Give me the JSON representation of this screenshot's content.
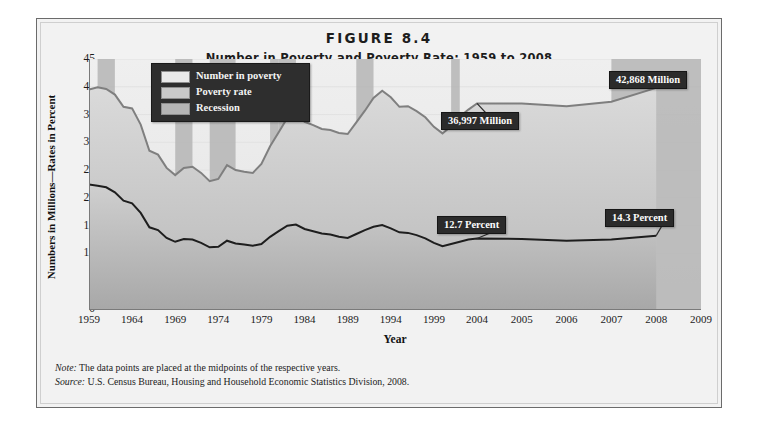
{
  "figure": {
    "number": "FIGURE 8.4",
    "title": "Number in Poverty and Poverty Rate: 1959 to 2008"
  },
  "axes": {
    "ylabel": "Numbers in Millions—Rates in Percent",
    "xlabel": "Year",
    "yticks": [
      "0",
      "5",
      "10",
      "15",
      "20",
      "25",
      "30",
      "35",
      "40",
      "45"
    ],
    "xticks": [
      "1959",
      "1964",
      "1969",
      "1974",
      "1979",
      "1984",
      "1989",
      "1994",
      "1999",
      "2004",
      "2005",
      "2006",
      "2007",
      "2008",
      "2009"
    ]
  },
  "legend": {
    "items": [
      {
        "label": "Number in poverty",
        "color": "#e9e9e9"
      },
      {
        "label": "Poverty rate",
        "color": "#c9c9c9"
      },
      {
        "label": "Recession",
        "color": "#b5b5b5"
      }
    ]
  },
  "callouts": [
    {
      "name": "number-in-poverty-2004",
      "text": "36,997 Million"
    },
    {
      "name": "number-in-poverty-2008",
      "text": "42,868 Million"
    },
    {
      "name": "poverty-rate-2004",
      "text": "12.7 Percent"
    },
    {
      "name": "poverty-rate-2008",
      "text": "14.3 Percent"
    }
  ],
  "notes": {
    "note_key": "Note:",
    "note_text": " The data points are placed at the midpoints of the respective years.",
    "source_key": "Source:",
    "source_text": " U.S. Census Bureau, Housing and Household Economic Statistics Division, 2008."
  },
  "colors": {
    "panel": "#f2f2f2",
    "plot": "#eeeeee",
    "number_line": "#7f7f7f",
    "rate_line": "#1e1e1e",
    "recession_bar": "#b5b5b5",
    "callout_bg": "#2b2b2b",
    "legend_bg": "#2e2e2e"
  },
  "chart_data": {
    "type": "area",
    "title": "Number in Poverty and Poverty Rate: 1959 to 2008",
    "xlabel": "Year",
    "ylabel": "Numbers in Millions—Rates in Percent",
    "ylim": [
      0,
      45
    ],
    "grid": true,
    "legend_position": "top-left",
    "x": [
      1959,
      1960,
      1961,
      1962,
      1963,
      1964,
      1965,
      1966,
      1967,
      1968,
      1969,
      1970,
      1971,
      1972,
      1973,
      1974,
      1975,
      1976,
      1977,
      1978,
      1979,
      1980,
      1981,
      1982,
      1983,
      1984,
      1985,
      1986,
      1987,
      1988,
      1989,
      1990,
      1991,
      1992,
      1993,
      1994,
      1995,
      1996,
      1997,
      1998,
      1999,
      2000,
      2001,
      2002,
      2003,
      2004,
      2005,
      2006,
      2007,
      2008
    ],
    "series": [
      {
        "name": "Number in poverty",
        "unit": "millions",
        "values": [
          39.5,
          39.9,
          39.6,
          38.6,
          36.4,
          36.1,
          33.2,
          28.5,
          27.8,
          25.4,
          24.1,
          25.4,
          25.6,
          24.5,
          23.0,
          23.4,
          25.9,
          25.0,
          24.7,
          24.5,
          26.1,
          29.3,
          31.8,
          34.4,
          35.3,
          33.7,
          33.1,
          32.4,
          32.2,
          31.7,
          31.5,
          33.6,
          35.7,
          38.0,
          39.3,
          38.1,
          36.4,
          36.5,
          35.6,
          34.5,
          32.8,
          31.6,
          32.9,
          34.6,
          35.9,
          37.0,
          37.0,
          36.5,
          37.3,
          39.8
        ]
      },
      {
        "name": "Poverty rate",
        "unit": "percent",
        "values": [
          22.4,
          22.2,
          21.9,
          21.0,
          19.5,
          19.0,
          17.3,
          14.7,
          14.2,
          12.8,
          12.1,
          12.6,
          12.5,
          11.9,
          11.1,
          11.2,
          12.3,
          11.8,
          11.6,
          11.4,
          11.7,
          13.0,
          14.0,
          15.0,
          15.2,
          14.4,
          14.0,
          13.6,
          13.4,
          13.0,
          12.8,
          13.5,
          14.2,
          14.8,
          15.1,
          14.5,
          13.8,
          13.7,
          13.3,
          12.7,
          11.9,
          11.3,
          11.7,
          12.1,
          12.5,
          12.7,
          12.6,
          12.3,
          12.5,
          13.2
        ]
      }
    ],
    "recessions": [
      {
        "start": 1960,
        "end": 1961
      },
      {
        "start": 1969,
        "end": 1970
      },
      {
        "start": 1973,
        "end": 1975
      },
      {
        "start": 1980,
        "end": 1980
      },
      {
        "start": 1981,
        "end": 1982
      },
      {
        "start": 1990,
        "end": 1991
      },
      {
        "start": 2001,
        "end": 2001
      },
      {
        "start": 2007,
        "end": 2008
      }
    ],
    "annotations": [
      {
        "x": 2004,
        "series": "Number in poverty",
        "y": 37.0,
        "label": "36,997 Million"
      },
      {
        "x": 2008,
        "series": "Number in poverty",
        "y": 39.8,
        "label": "42,868 Million"
      },
      {
        "x": 2004,
        "series": "Poverty rate",
        "y": 12.7,
        "label": "12.7 Percent"
      },
      {
        "x": 2008,
        "series": "Poverty rate",
        "y": 13.2,
        "label": "14.3 Percent"
      }
    ]
  }
}
